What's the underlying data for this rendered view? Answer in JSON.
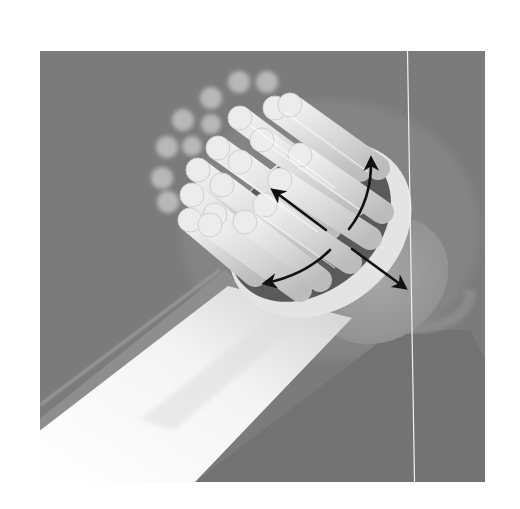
{
  "figure": {
    "frame": {
      "x": 40,
      "y": 51,
      "width": 445,
      "height": 431
    },
    "colors": {
      "page_background": "#ffffff",
      "frame_background": "#7b7b7b",
      "handle_highlight": "#fafafa",
      "handle_mid": "#d8d8d8",
      "bristle_light": "#e6e6e6",
      "bristle_shade": "#bdbdbd",
      "ring": "#e2e2e2",
      "shadow": "#555555",
      "arrow": "#111111",
      "divider_line": "#eeeeee"
    },
    "arrows": [
      {
        "name": "linear-up-left",
        "from": [
          326,
          230
        ],
        "to": [
          272,
          189
        ]
      },
      {
        "name": "linear-down-right",
        "from": [
          352,
          249
        ],
        "to": [
          406,
          289
        ]
      },
      {
        "name": "rotate-up",
        "from": [
          349,
          229
        ],
        "to": [
          372,
          157
        ]
      },
      {
        "name": "rotate-down-left",
        "from": [
          330,
          250
        ],
        "to": [
          263,
          284
        ]
      }
    ]
  }
}
